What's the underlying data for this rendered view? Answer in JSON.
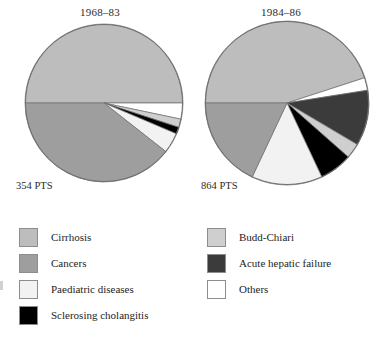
{
  "figure": {
    "charts": [
      {
        "title": "1968–83",
        "total_label": "354 PTS"
      },
      {
        "title": "1984–86",
        "total_label": "864 PTS"
      }
    ]
  },
  "legend": {
    "left_column": [
      {
        "label": "Cirrhosis",
        "color": "#bdbdbd",
        "swatch_name": "swatch-cirrhosis"
      },
      {
        "label": "Cancers",
        "color": "#9e9e9e",
        "swatch_name": "swatch-cancers"
      },
      {
        "label": "Paediatric diseases",
        "color": "#f2f2f2",
        "swatch_name": "swatch-paediatric-diseases"
      },
      {
        "label": "Sclerosing cholangitis",
        "color": "#000000",
        "swatch_name": "swatch-sclerosing-cholangitis"
      }
    ],
    "right_column": [
      {
        "label": "Budd-Chiari",
        "color": "#cfcfcf",
        "swatch_name": "swatch-budd-chiari"
      },
      {
        "label": "Acute hepatic failure",
        "color": "#3b3b3b",
        "swatch_name": "swatch-acute-hepatic-failure"
      },
      {
        "label": "Others",
        "color": "#ffffff",
        "swatch_name": "swatch-others"
      }
    ]
  },
  "chart_data": [
    {
      "type": "pie",
      "title": "1968–83",
      "subtitle": "354 PTS",
      "total_patients": 354,
      "start_angle_deg": 180,
      "direction": "clockwise",
      "labels": [
        "Cirrhosis",
        "Others",
        "Budd-Chiari",
        "Sclerosing cholangitis",
        "Paediatric diseases",
        "Cancers"
      ],
      "values": [
        50.0,
        3.3,
        1.7,
        1.4,
        4.2,
        39.4
      ],
      "units": "percent",
      "colors": [
        "#bdbdbd",
        "#ffffff",
        "#cfcfcf",
        "#000000",
        "#f2f2f2",
        "#9e9e9e"
      ],
      "legend_position": "below",
      "grid": false
    },
    {
      "type": "pie",
      "title": "1984–86",
      "subtitle": "864 PTS",
      "total_patients": 864,
      "start_angle_deg": 180,
      "direction": "clockwise",
      "labels": [
        "Cirrhosis",
        "Others",
        "Acute hepatic failure",
        "Budd-Chiari",
        "Sclerosing cholangitis",
        "Paediatric diseases",
        "Cancers"
      ],
      "values": [
        45.0,
        2.5,
        11.0,
        3.0,
        6.5,
        14.0,
        18.0
      ],
      "units": "percent",
      "colors": [
        "#bdbdbd",
        "#ffffff",
        "#3b3b3b",
        "#cfcfcf",
        "#000000",
        "#f2f2f2",
        "#9e9e9e"
      ],
      "legend_position": "below",
      "grid": false
    }
  ]
}
